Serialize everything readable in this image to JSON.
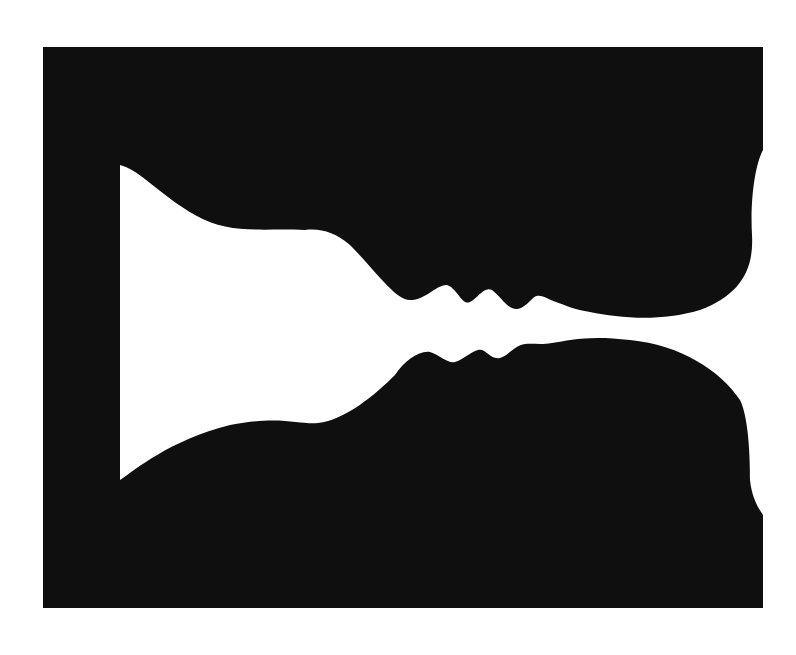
{
  "image": {
    "subject": "Rubin vase illusion — two facing profiles forming a white vase",
    "colors": {
      "background": "#ffffff",
      "figure": "#0f0f0f",
      "vase": "#ffffff"
    },
    "frame": {
      "left": 43,
      "top": 47,
      "right": 763,
      "bottom": 608
    }
  }
}
